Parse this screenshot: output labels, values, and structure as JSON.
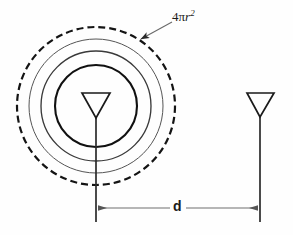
{
  "figure": {
    "type": "technical-diagram",
    "background_color": "#fefefe",
    "stroke_color": "#1a1a1a"
  },
  "labels": {
    "sphere_area": {
      "full_text": "4πr²",
      "coefficient": "4",
      "pi_symbol": "π",
      "variable": "r",
      "exponent": "2"
    },
    "distance": {
      "text": "d"
    }
  },
  "wavefronts": {
    "center": {
      "x": 96,
      "y": 106
    },
    "count": 4,
    "circles": [
      {
        "name": "innermost-wavefront",
        "radius": 41,
        "style": "solid",
        "stroke_width": 2.1
      },
      {
        "name": "second-wavefront",
        "radius": 55,
        "style": "solid",
        "stroke_width": 1.3
      },
      {
        "name": "third-wavefront",
        "radius": 67,
        "style": "solid",
        "stroke_width": 1.0
      },
      {
        "name": "outer-sphere-boundary",
        "radius": 79,
        "style": "dashed",
        "stroke_width": 2.2,
        "dash_pattern": "7,4"
      }
    ]
  },
  "antennas": {
    "transmit": {
      "name": "transmitting-antenna",
      "triangle": {
        "left": 82,
        "right": 110,
        "top": 93,
        "apex_x": 96,
        "apex_y": 118
      },
      "mast": {
        "x": 96,
        "top": 118,
        "bottom": 222
      }
    },
    "receive": {
      "name": "receiving-antenna",
      "triangle": {
        "left": 247,
        "right": 274,
        "top": 93,
        "apex_x": 260,
        "apex_y": 117
      },
      "mast": {
        "x": 260,
        "top": 117,
        "bottom": 222
      }
    }
  },
  "dimension": {
    "name": "distance-dimension-line",
    "y": 208,
    "x_start": 96,
    "x_end": 260,
    "arrowheads": "both-ends"
  },
  "leader": {
    "name": "sphere-area-leader-line",
    "from": {
      "x": 171,
      "y": 22
    },
    "to": {
      "x": 139,
      "y": 40
    },
    "arrowhead": "at-circle"
  }
}
